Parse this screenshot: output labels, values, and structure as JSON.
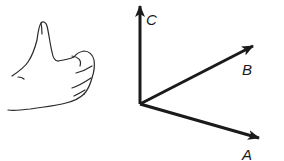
{
  "diagram": {
    "hand": {
      "icon": "thumbs-up-hand-icon"
    },
    "origin": {
      "x": 140,
      "y": 104
    },
    "vectors": [
      {
        "label": "C",
        "tip": {
          "x": 140,
          "y": 5
        },
        "label_pos": {
          "x": 146,
          "y": 24
        }
      },
      {
        "label": "B",
        "tip": {
          "x": 254,
          "y": 46
        },
        "label_pos": {
          "x": 242,
          "y": 75
        }
      },
      {
        "label": "A",
        "tip": {
          "x": 260,
          "y": 138
        },
        "label_pos": {
          "x": 242,
          "y": 160
        }
      }
    ],
    "line_color": "#1a1a1a"
  }
}
